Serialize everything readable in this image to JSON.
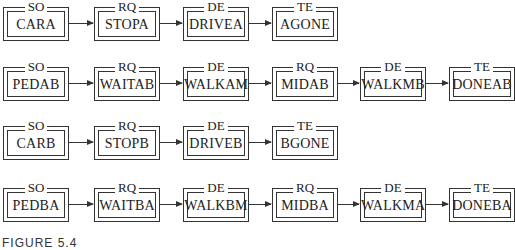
{
  "rows": [
    {
      "boxes": [
        {
          "tag": "SO",
          "name": "CARA"
        },
        {
          "tag": "RQ",
          "name": "STOPA"
        },
        {
          "tag": "DE",
          "name": "DRIVEA"
        },
        {
          "tag": "TE",
          "name": "AGONE"
        }
      ]
    },
    {
      "boxes": [
        {
          "tag": "SO",
          "name": "PEDAB"
        },
        {
          "tag": "RQ",
          "name": "WAITAB"
        },
        {
          "tag": "DE",
          "name": "WALKAM"
        },
        {
          "tag": "RQ",
          "name": "MIDAB"
        },
        {
          "tag": "DE",
          "name": "WALKMB"
        },
        {
          "tag": "TE",
          "name": "DONEAB"
        }
      ]
    },
    {
      "boxes": [
        {
          "tag": "SO",
          "name": "CARB"
        },
        {
          "tag": "RQ",
          "name": "STOPB"
        },
        {
          "tag": "DE",
          "name": "DRIVEB"
        },
        {
          "tag": "TE",
          "name": "BGONE"
        }
      ]
    },
    {
      "boxes": [
        {
          "tag": "SO",
          "name": "PEDBA"
        },
        {
          "tag": "RQ",
          "name": "WAITBA"
        },
        {
          "tag": "DE",
          "name": "WALKBM"
        },
        {
          "tag": "RQ",
          "name": "MIDBA"
        },
        {
          "tag": "DE",
          "name": "WALKMA"
        },
        {
          "tag": "TE",
          "name": "DONEBA"
        }
      ]
    }
  ],
  "caption": "FIGURE 5.4"
}
